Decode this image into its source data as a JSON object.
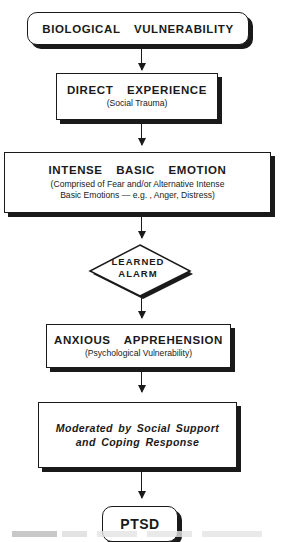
{
  "diagram": {
    "type": "flowchart",
    "nodes": [
      {
        "id": "biological-vulnerability",
        "shape": "rounded-rectangle",
        "title": "BIOLOGICAL  VULNERABILITY",
        "subtitle": ""
      },
      {
        "id": "direct-experience",
        "shape": "rectangle",
        "title": "DIRECT  EXPERIENCE",
        "subtitle": "(Social Trauma)"
      },
      {
        "id": "intense-basic-emotion",
        "shape": "rectangle",
        "title": "INTENSE  BASIC  EMOTION",
        "subtitle_line1": "(Comprised of Fear and/or Alternative Intense",
        "subtitle_line2": "Basic Emotions — e.g. , Anger, Distress)"
      },
      {
        "id": "learned-alarm",
        "shape": "diamond",
        "line1": "LEARNED",
        "line2": "ALARM"
      },
      {
        "id": "anxious-apprehension",
        "shape": "rectangle",
        "title": "ANXIOUS  APPREHENSION",
        "subtitle": "(Psychological Vulnerability)"
      },
      {
        "id": "moderated",
        "shape": "rectangle",
        "line1": "Moderated by Social Support",
        "line2": "and Coping Response"
      },
      {
        "id": "ptsd",
        "shape": "rounded-rectangle",
        "title": "PTSD"
      }
    ],
    "edges": [
      {
        "from": "biological-vulnerability",
        "to": "direct-experience"
      },
      {
        "from": "direct-experience",
        "to": "intense-basic-emotion"
      },
      {
        "from": "intense-basic-emotion",
        "to": "learned-alarm"
      },
      {
        "from": "learned-alarm",
        "to": "anxious-apprehension"
      },
      {
        "from": "anxious-apprehension",
        "to": "moderated"
      },
      {
        "from": "moderated",
        "to": "ptsd"
      }
    ]
  },
  "colors": {
    "ink": "#1a1a1a",
    "background": "#ffffff"
  }
}
